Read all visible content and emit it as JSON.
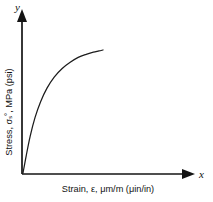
{
  "figure": {
    "background_color": "#ffffff",
    "ink_color": "#1a1a1a"
  },
  "axes": {
    "x_letter": "x",
    "y_letter": "y",
    "x_title": "Strain, ε, μm/m (μin/in)",
    "y_title": "Stress, σₛ˚, MPa (psi)"
  },
  "chart_data": {
    "type": "line",
    "title": "",
    "subtitle": "",
    "xlabel": "Strain, ε, μm/m (μin/in)",
    "ylabel": "Stress, σₛ˚, MPa (psi)",
    "grid": false,
    "legend": false,
    "legend_position": "none",
    "xticks": [],
    "yticks": [],
    "xtick_labels": [],
    "ytick_labels": [],
    "xlim": [
      0,
      1
    ],
    "ylim": [
      0,
      1
    ],
    "series": [
      {
        "name": "stress-strain curve",
        "x": [
          0.0,
          0.04,
          0.09,
          0.15,
          0.22,
          0.3,
          0.39,
          0.49,
          0.59,
          0.69,
          0.79,
          0.88,
          0.95,
          1.0
        ],
        "y": [
          0.0,
          0.14,
          0.3,
          0.45,
          0.58,
          0.69,
          0.78,
          0.85,
          0.9,
          0.94,
          0.965,
          0.982,
          0.992,
          1.0
        ]
      }
    ],
    "annotations": []
  }
}
